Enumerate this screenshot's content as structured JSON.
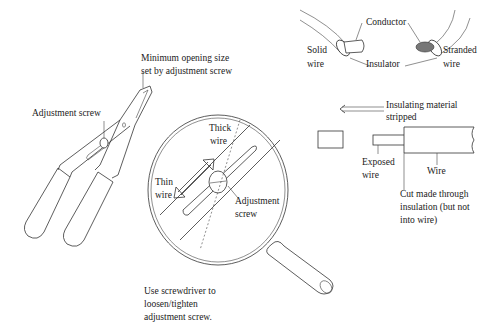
{
  "diagram": {
    "stripper": {
      "min_opening_label_line1": "Minimum opening size",
      "min_opening_label_line2": "set by adjustment screw",
      "adjustment_screw_label": "Adjustment screw"
    },
    "magnifier": {
      "thick_wire_line1": "Thick",
      "thick_wire_line2": "wire",
      "thin_wire_line1": "Thin",
      "thin_wire_line2": "wire",
      "adjustment_screw_line1": "Adjustment",
      "adjustment_screw_line2": "screw"
    },
    "instruction": {
      "line1": "Use screwdriver to",
      "line2": "loosen/tighten",
      "line3": "adjustment screw."
    },
    "wire_types": {
      "conductor": "Conductor",
      "insulator": "Insulator",
      "solid_line1": "Solid",
      "solid_line2": "wire",
      "stranded_line1": "Stranded",
      "stranded_line2": "wire"
    },
    "stripping": {
      "insulating_line1": "Insulating material",
      "insulating_line2": "stripped",
      "exposed_line1": "Exposed",
      "exposed_line2": "wire",
      "wire": "Wire",
      "cut_line1": "Cut made through",
      "cut_line2": "insulation (but not",
      "cut_line3": "into wire)"
    }
  }
}
